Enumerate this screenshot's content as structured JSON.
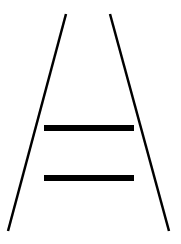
{
  "figure": {
    "name": "Ponzo illusion",
    "background": "#ffffff",
    "stroke_color": "#000000",
    "converging_lines": [
      {
        "id": "left-rail",
        "x1": 66,
        "y1": 14,
        "x2": 8,
        "y2": 231,
        "width": 2.5
      },
      {
        "id": "right-rail",
        "x1": 110,
        "y1": 14,
        "x2": 169,
        "y2": 231,
        "width": 2.5
      }
    ],
    "bars": [
      {
        "id": "upper-bar",
        "x": 44,
        "y": 125,
        "w": 90,
        "h": 6
      },
      {
        "id": "lower-bar",
        "x": 44,
        "y": 175,
        "w": 90,
        "h": 6
      }
    ]
  }
}
